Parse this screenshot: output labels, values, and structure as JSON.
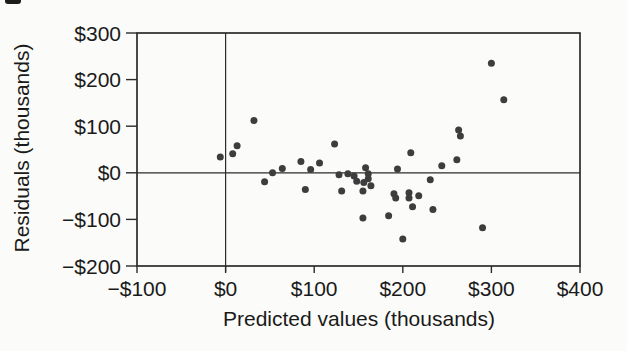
{
  "figure": {
    "background": "#fbfbf9",
    "artifact_color": "#1c1c1c"
  },
  "chart_data": {
    "type": "scatter",
    "title": "",
    "xlabel": "Predicted values (thousands)",
    "ylabel": "Residuals (thousands)",
    "xlim": [
      -100,
      400
    ],
    "ylim": [
      -200,
      300
    ],
    "x_ticks": [
      -100,
      0,
      100,
      200,
      300,
      400
    ],
    "x_tick_labels": [
      "−$100",
      "$0",
      "$100",
      "$200",
      "$300",
      "$400"
    ],
    "y_ticks": [
      300,
      200,
      100,
      0,
      -100,
      -200
    ],
    "y_tick_labels": [
      "$300",
      "$200",
      "$100",
      "$0",
      "−$100",
      "−$200"
    ],
    "reference_line_x": 0,
    "reference_line_y": 0,
    "grid": false,
    "legend": null,
    "point_color": "#3d3d3d",
    "axis_color": "#2b2b2b",
    "text_color": "#1a1a1a",
    "points": [
      [
        -6,
        34
      ],
      [
        8,
        41
      ],
      [
        13,
        58
      ],
      [
        32,
        112
      ],
      [
        44,
        -19
      ],
      [
        53,
        0
      ],
      [
        64,
        9
      ],
      [
        85,
        24
      ],
      [
        90,
        -36
      ],
      [
        96,
        7
      ],
      [
        106,
        21
      ],
      [
        123,
        62
      ],
      [
        128,
        -4
      ],
      [
        131,
        -39
      ],
      [
        138,
        -2
      ],
      [
        145,
        -7
      ],
      [
        148,
        -18
      ],
      [
        155,
        -39
      ],
      [
        155,
        -97
      ],
      [
        156,
        -21
      ],
      [
        158,
        11
      ],
      [
        161,
        -2
      ],
      [
        161,
        -13
      ],
      [
        164,
        -28
      ],
      [
        184,
        -92
      ],
      [
        190,
        -45
      ],
      [
        192,
        -54
      ],
      [
        194,
        8
      ],
      [
        200,
        -142
      ],
      [
        207,
        -43
      ],
      [
        207,
        -54
      ],
      [
        209,
        43
      ],
      [
        211,
        -73
      ],
      [
        218,
        -49
      ],
      [
        231,
        -15
      ],
      [
        234,
        -79
      ],
      [
        244,
        15
      ],
      [
        261,
        28
      ],
      [
        263,
        92
      ],
      [
        265,
        79
      ],
      [
        290,
        -118
      ],
      [
        300,
        235
      ],
      [
        314,
        157
      ]
    ]
  }
}
